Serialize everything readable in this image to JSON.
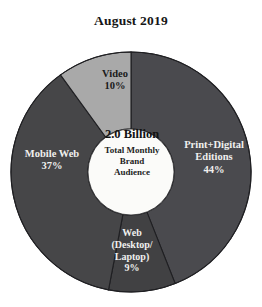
{
  "chart": {
    "title": "August 2019",
    "center": {
      "headline": "2.0 Billion",
      "sub_lines": [
        "Total Monthly",
        "Brand",
        "Audience"
      ]
    },
    "labels": {
      "print": {
        "line1": "Print+Digital",
        "line2": "Editions",
        "value": "44%"
      },
      "mobile": {
        "line1": "Mobile Web",
        "value": "37%"
      },
      "video": {
        "line1": "Video",
        "value": "10%"
      },
      "web": {
        "line1": "Web",
        "line2": "(Desktop/",
        "line3": "Laptop)",
        "value": "9%"
      }
    }
  },
  "chart_data": {
    "type": "pie",
    "variant": "donut",
    "title": "August 2019",
    "subtitle": "",
    "xlabel": "",
    "ylabel": "",
    "grid": false,
    "legend_position": "none",
    "label_placement": "inside-slices",
    "start_angle_deg": 0,
    "direction": "clockwise",
    "inner_radius_ratio": 0.36,
    "center_annotation": {
      "value": "2.0 Billion",
      "description": "Total Monthly Brand Audience"
    },
    "units": "percent of total monthly brand audience",
    "total": "2.0 Billion",
    "categories": [
      "Print+Digital Editions",
      "Web (Desktop/Laptop)",
      "Mobile Web",
      "Video"
    ],
    "values": [
      44,
      9,
      37,
      10
    ],
    "value_labels": [
      "44%",
      "9%",
      "37%",
      "10%"
    ],
    "colors": [
      "#4a4a4e",
      "#414143",
      "#464648",
      "#a9a9a9"
    ],
    "label_text_colors": [
      "#f0f0ee",
      "#f0f0ee",
      "#f0f0ee",
      "#1b1b1b"
    ],
    "slices": [
      {
        "name": "Print+Digital Editions",
        "value": 44,
        "label": "44%",
        "color": "#4a4a4e",
        "start_deg": 0,
        "end_deg": 158.4
      },
      {
        "name": "Web (Desktop/Laptop)",
        "value": 9,
        "label": "9%",
        "color": "#414143",
        "start_deg": 158.4,
        "end_deg": 190.8
      },
      {
        "name": "Mobile Web",
        "value": 37,
        "label": "37%",
        "color": "#464648",
        "start_deg": 190.8,
        "end_deg": 324.0
      },
      {
        "name": "Video",
        "value": 10,
        "label": "10%",
        "color": "#a9a9a9",
        "start_deg": 324.0,
        "end_deg": 360.0
      }
    ]
  },
  "colors": {
    "background": "#ffffff",
    "slice_print": "#4a4a4e",
    "slice_web": "#414143",
    "slice_mobile": "#464648",
    "slice_video": "#a9a9a9",
    "slice_divider": "#1f1f22",
    "hole": "#fbfbf9",
    "text_dark": "#1b1b1b",
    "text_light": "#f0f0ee"
  }
}
